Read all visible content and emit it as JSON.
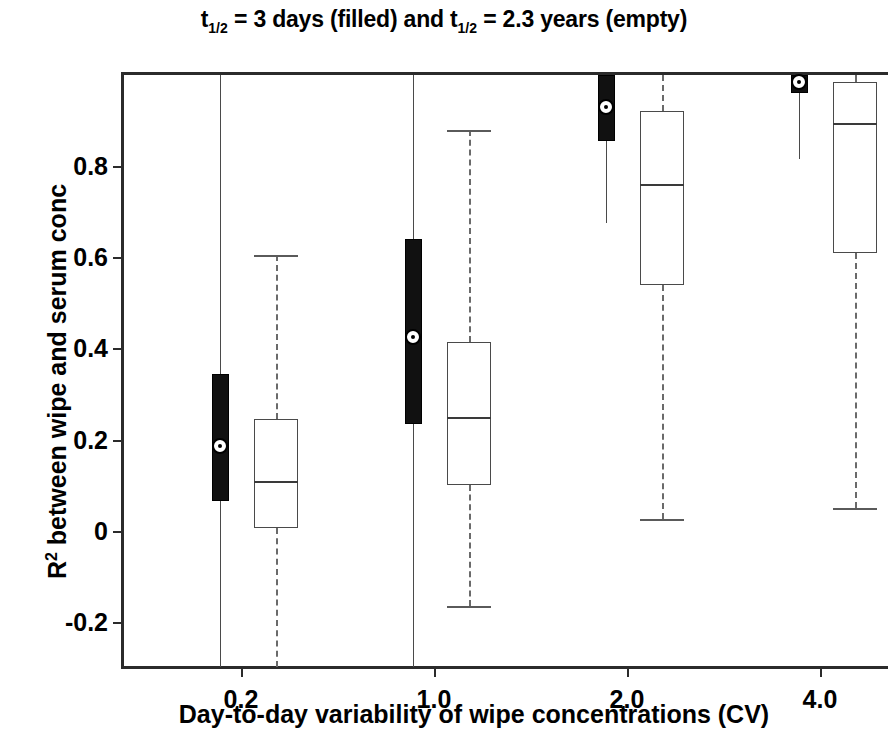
{
  "chart_data": {
    "type": "box",
    "title": "t1/2 = 3 days (filled) and t1/2 = 2.3 years (empty)",
    "title_parts": {
      "t_a": "t",
      "sub_a": "1/2",
      "mid_a": " = 3 days (filled) and ",
      "t_b": "t",
      "sub_b": "1/2",
      "mid_b": " = 2.3 years (empty)"
    },
    "xlabel": "Day-to-day variability of wipe concentrations (CV)",
    "ylabel": "R2 between wipe and serum conc",
    "ylabel_parts": {
      "r": "R",
      "sup": "2",
      "rest": " between wipe and serum conc"
    },
    "categories": [
      "0.2",
      "1.0",
      "2.0",
      "4.0"
    ],
    "ytick_labels": [
      "0.8",
      "0.6",
      "0.4",
      "0.2",
      "0",
      "-0.2"
    ],
    "ytick_values": [
      0.8,
      0.6,
      0.4,
      0.2,
      0,
      -0.2
    ],
    "ylim": [
      -0.31,
      1.0
    ],
    "grid": false,
    "legend": "encoded in title: filled = 3 days, empty = 2.3 years",
    "series": [
      {
        "name": "t1/2 = 3 days (filled)",
        "style": "filled",
        "boxes": [
          {
            "category": "0.2",
            "whisker_low": -0.3,
            "q1": 0.065,
            "median": 0.185,
            "q3": 0.345,
            "whisker_high": 1.0,
            "cap_low": false,
            "cap_high": false
          },
          {
            "category": "1.0",
            "whisker_low": -0.3,
            "q1": 0.235,
            "median": 0.425,
            "q3": 0.64,
            "whisker_high": 1.0,
            "cap_low": false,
            "cap_high": false
          },
          {
            "category": "2.0",
            "whisker_low": 0.675,
            "q1": 0.855,
            "median": 0.93,
            "q3": 1.0,
            "whisker_high": 1.0,
            "cap_low": false,
            "cap_high": false
          },
          {
            "category": "4.0",
            "whisker_low": 0.815,
            "q1": 0.96,
            "median": 0.985,
            "q3": 1.0,
            "whisker_high": 1.0,
            "cap_low": false,
            "cap_high": false
          }
        ]
      },
      {
        "name": "t1/2 = 2.3 years (empty)",
        "style": "empty",
        "boxes": [
          {
            "category": "0.2",
            "whisker_low": -0.3,
            "q1": 0.005,
            "median": 0.11,
            "q3": 0.245,
            "whisker_high": 0.605,
            "cap_low": false,
            "cap_high": true
          },
          {
            "category": "1.0",
            "whisker_low": -0.165,
            "q1": 0.1,
            "median": 0.25,
            "q3": 0.415,
            "whisker_high": 0.88,
            "cap_low": true,
            "cap_high": true
          },
          {
            "category": "2.0",
            "whisker_low": 0.025,
            "q1": 0.54,
            "median": 0.76,
            "q3": 0.92,
            "whisker_high": 1.0,
            "cap_low": true,
            "cap_high": false
          },
          {
            "category": "4.0",
            "whisker_low": 0.05,
            "q1": 0.61,
            "median": 0.895,
            "q3": 0.985,
            "whisker_high": 1.0,
            "cap_low": true,
            "cap_high": false
          }
        ]
      }
    ]
  }
}
